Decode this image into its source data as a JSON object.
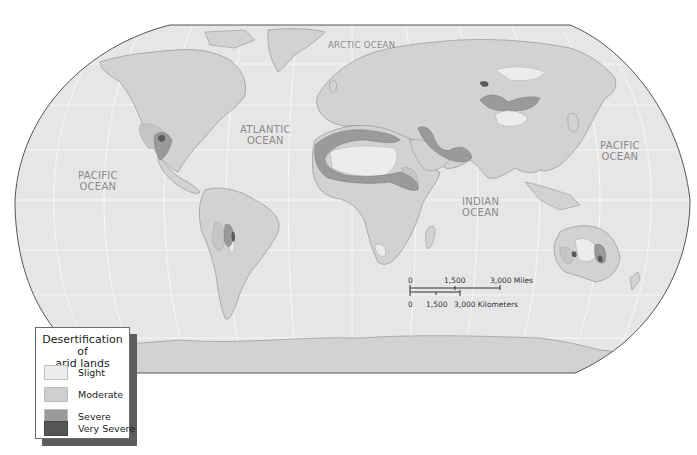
{
  "map": {
    "projection": "Robinson world map",
    "colors": {
      "ocean": "#e6e6e6",
      "land": "#d2d2d2",
      "border": "#5a5a5a",
      "graticule": "#f6f6f6"
    },
    "ocean_labels": [
      {
        "name": "arctic",
        "line1": "ARCTIC  OCEAN",
        "line2": ""
      },
      {
        "name": "atlantic",
        "line1": "ATLANTIC",
        "line2": "OCEAN"
      },
      {
        "name": "pacific-west",
        "line1": "PACIFIC",
        "line2": "OCEAN"
      },
      {
        "name": "pacific-east",
        "line1": "PACIFIC",
        "line2": "OCEAN"
      },
      {
        "name": "indian",
        "line1": "INDIAN",
        "line2": "OCEAN"
      }
    ]
  },
  "legend": {
    "title_line1": "Desertification of",
    "title_line2": "arid lands",
    "items": [
      {
        "label": "Slight",
        "color": "#ececec"
      },
      {
        "label": "Moderate",
        "color": "#cfcfcf"
      },
      {
        "label": "Severe",
        "color": "#9a9a9a"
      },
      {
        "label": "Very Severe",
        "color": "#555555"
      }
    ]
  },
  "scale_bar": {
    "miles": {
      "ticks": [
        "0",
        "1,500",
        "3,000 Miles"
      ]
    },
    "kilometers": {
      "ticks": [
        "0",
        "1,500",
        "3,000 Kilometers"
      ]
    }
  }
}
